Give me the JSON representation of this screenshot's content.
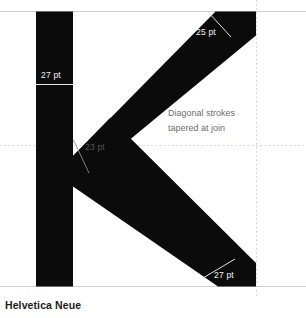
{
  "specimen": {
    "caption": "Helvetica Neue",
    "glyph": "K",
    "note": "Diagonal strokes\ntapered at join",
    "measurements": {
      "stem_width": "27 pt",
      "arm_width": "25 pt",
      "join_width": "23 pt",
      "leg_width": "27 pt"
    },
    "colors": {
      "glyph_fill": "#0b0b0b",
      "page_background": "#ffffff",
      "solid_guide": "#cfcfcf",
      "dotted_guide": "#d8d8d8",
      "measure_rule_dark": "#e8e8e8",
      "measure_rule_light": "#8c8c8c",
      "caption_text": "#1b1b1b",
      "note_text": "#6e6e6e",
      "label_on_dark": "#f2f2f2",
      "label_on_light": "#555555"
    },
    "guides": {
      "cap_height_label": "cap-height",
      "midline_label": "midline",
      "baseline_label": "baseline",
      "right_sidebearing_label": "right-sidebearing"
    }
  }
}
